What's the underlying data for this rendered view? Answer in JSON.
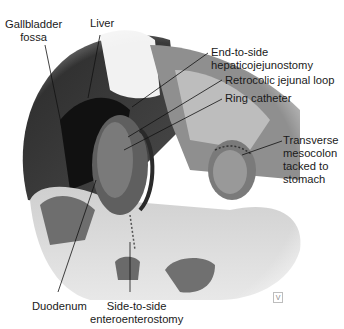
{
  "figure": {
    "type": "anatomical-illustration",
    "style": "grayscale",
    "labels": [
      {
        "id": "gallbladder-fossa",
        "lines": [
          "Gallbladder",
          "fossa"
        ]
      },
      {
        "id": "liver",
        "lines": [
          "Liver"
        ]
      },
      {
        "id": "end-to-side",
        "lines": [
          "End-to-side",
          "hepaticojejunostomy"
        ]
      },
      {
        "id": "retrocolic",
        "lines": [
          "Retrocolic jejunal loop"
        ]
      },
      {
        "id": "ring-catheter",
        "lines": [
          "Ring catheter"
        ]
      },
      {
        "id": "transverse-mesocolon",
        "lines": [
          "Transverse",
          "mesocolon",
          "tacked to",
          "stomach"
        ]
      },
      {
        "id": "duodenum",
        "lines": [
          "Duodenum"
        ]
      },
      {
        "id": "side-to-side",
        "lines": [
          "Side-to-side",
          "enteroenterostomy"
        ]
      }
    ],
    "corner_mark": "V"
  }
}
